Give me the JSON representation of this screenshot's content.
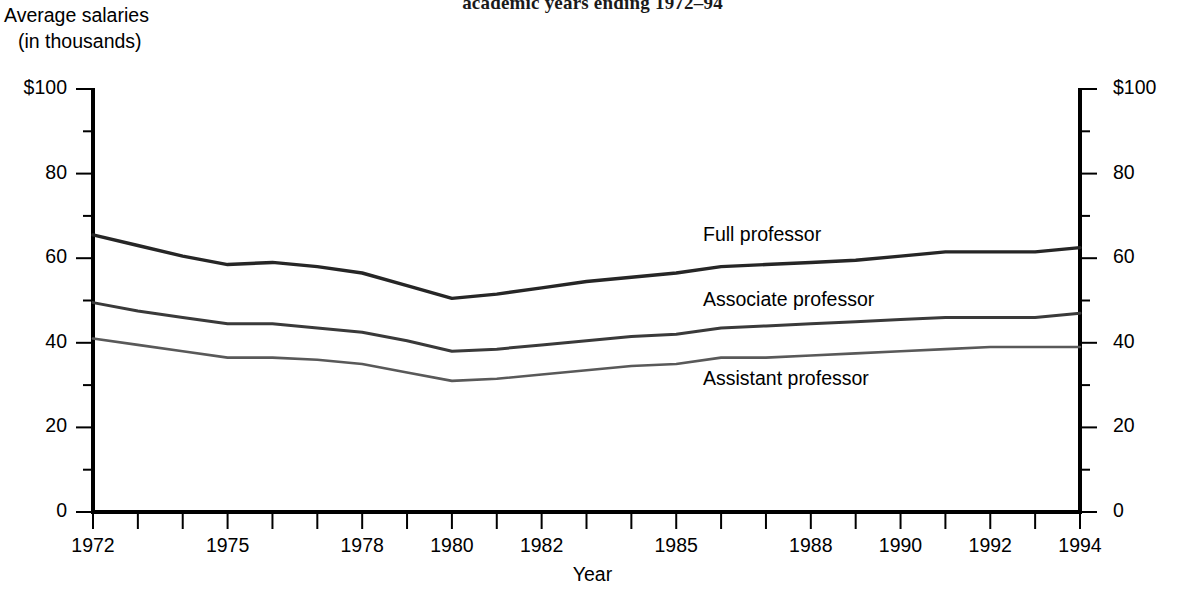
{
  "title": {
    "line2": "academic years ending 1972–94"
  },
  "axes": {
    "y_axis_caption_line1": "Average salaries",
    "y_axis_caption_line2": "(in thousands)",
    "x_axis_title": "Year",
    "y_tick_labels": [
      "$100",
      "80",
      "60",
      "40",
      "20",
      "0"
    ],
    "y_tick_values": [
      100,
      80,
      60,
      40,
      20,
      0
    ],
    "y_minor_tick_values": [
      90,
      70,
      50,
      30,
      10
    ],
    "x_tick_labels": [
      "1972",
      "1975",
      "1978",
      "1980",
      "1982",
      "1985",
      "1988",
      "1990",
      "1992",
      "1994"
    ],
    "x_tick_values": [
      1972,
      1975,
      1978,
      1980,
      1982,
      1985,
      1988,
      1990,
      1992,
      1994
    ],
    "x_all_tick_values": [
      1972,
      1973,
      1974,
      1975,
      1976,
      1977,
      1978,
      1979,
      1980,
      1981,
      1982,
      1983,
      1984,
      1985,
      1986,
      1987,
      1988,
      1989,
      1990,
      1991,
      1992,
      1993,
      1994
    ]
  },
  "series_labels": {
    "full": "Full professor",
    "associate": "Associate professor",
    "assistant": "Assistant professor"
  },
  "colors": {
    "full": "#262626",
    "associate": "#3a3a3a",
    "assistant": "#595959",
    "axis": "#000000",
    "text": "#000000"
  },
  "chart_data": {
    "type": "line",
    "title": "academic years ending 1972–94",
    "xlabel": "Year",
    "ylabel": "Average salaries (in thousands)",
    "xlim": [
      1972,
      1994
    ],
    "ylim": [
      0,
      100
    ],
    "grid": false,
    "legend_position": "inline-right",
    "x": [
      1972,
      1973,
      1974,
      1975,
      1976,
      1977,
      1978,
      1979,
      1980,
      1981,
      1982,
      1983,
      1984,
      1985,
      1986,
      1987,
      1988,
      1989,
      1990,
      1991,
      1992,
      1993,
      1994
    ],
    "series": [
      {
        "name": "Full professor",
        "values": [
          65.5,
          63.0,
          60.5,
          58.5,
          59.0,
          58.0,
          56.5,
          53.5,
          50.5,
          51.5,
          53.0,
          54.5,
          55.5,
          56.5,
          58.0,
          58.5,
          59.0,
          59.5,
          60.5,
          61.5,
          61.5,
          61.5,
          62.5
        ]
      },
      {
        "name": "Associate professor",
        "values": [
          49.5,
          47.5,
          46.0,
          44.5,
          44.5,
          43.5,
          42.5,
          40.5,
          38.0,
          38.5,
          39.5,
          40.5,
          41.5,
          42.0,
          43.5,
          44.0,
          44.5,
          45.0,
          45.5,
          46.0,
          46.0,
          46.0,
          47.0
        ]
      },
      {
        "name": "Assistant professor",
        "values": [
          41.0,
          39.5,
          38.0,
          36.5,
          36.5,
          36.0,
          35.0,
          33.0,
          31.0,
          31.5,
          32.5,
          33.5,
          34.5,
          35.0,
          36.5,
          36.5,
          37.0,
          37.5,
          38.0,
          38.5,
          39.0,
          39.0,
          39.0
        ]
      }
    ]
  }
}
